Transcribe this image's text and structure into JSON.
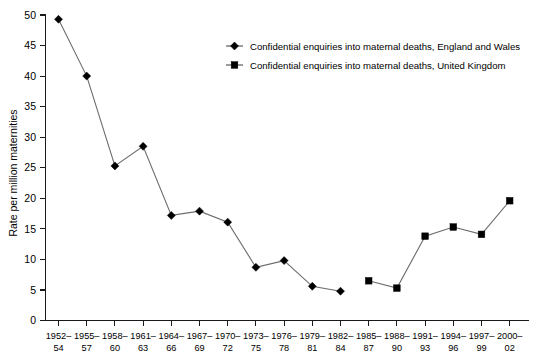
{
  "chart_data": {
    "type": "line",
    "title": "",
    "xlabel": "",
    "ylabel": "Rate per million maternities",
    "ylim": [
      0,
      50
    ],
    "ytick_step": 5,
    "grid": false,
    "legend_position": "top-center-right",
    "categories": [
      "1952-\n54",
      "1955-\n57",
      "1958-\n60",
      "1961-\n63",
      "1964-\n66",
      "1967-\n69",
      "1970-\n72",
      "1973-\n75",
      "1976-\n78",
      "1979-\n81",
      "1982-\n84",
      "1985-\n87",
      "1988-\n90",
      "1991-\n93",
      "1994-\n96",
      "1997-\n99",
      "2000-\n02"
    ],
    "category_lines": [
      [
        "1952–",
        "54"
      ],
      [
        "1955–",
        "57"
      ],
      [
        "1958–",
        "60"
      ],
      [
        "1961–",
        "63"
      ],
      [
        "1964–",
        "66"
      ],
      [
        "1967–",
        "69"
      ],
      [
        "1970–",
        "72"
      ],
      [
        "1973–",
        "75"
      ],
      [
        "1976–",
        "78"
      ],
      [
        "1979–",
        "81"
      ],
      [
        "1982–",
        "84"
      ],
      [
        "1985–",
        "87"
      ],
      [
        "1988–",
        "90"
      ],
      [
        "1991–",
        "93"
      ],
      [
        "1994–",
        "96"
      ],
      [
        "1997–",
        "99"
      ],
      [
        "2000–",
        "02"
      ]
    ],
    "ytick_labels": [
      "0",
      "5",
      "10",
      "15",
      "20",
      "25",
      "30",
      "35",
      "40",
      "45",
      "50"
    ],
    "ytick_values": [
      0,
      5,
      10,
      15,
      20,
      25,
      30,
      35,
      40,
      45,
      50
    ],
    "series": [
      {
        "name": "Confidential enquiries into maternal deaths, England and Wales",
        "marker": "diamond",
        "color": "#000000",
        "values": [
          49.3,
          40.0,
          25.3,
          28.5,
          17.2,
          17.9,
          16.1,
          8.7,
          9.8,
          5.6,
          4.8,
          null,
          null,
          null,
          null,
          null,
          null
        ]
      },
      {
        "name": "Confidential enquiries into maternal deaths, United Kingdom",
        "marker": "square",
        "color": "#000000",
        "values": [
          null,
          null,
          null,
          null,
          null,
          null,
          null,
          null,
          null,
          null,
          null,
          6.5,
          5.3,
          13.8,
          15.3,
          14.1,
          19.6
        ]
      }
    ]
  },
  "legend": {
    "entries": [
      {
        "label": "Confidential enquiries into maternal deaths, England and Wales",
        "marker": "diamond"
      },
      {
        "label": "Confidential enquiries into maternal deaths, United Kingdom",
        "marker": "square"
      }
    ]
  },
  "axes": {
    "y_title": "Rate per million maternities"
  }
}
